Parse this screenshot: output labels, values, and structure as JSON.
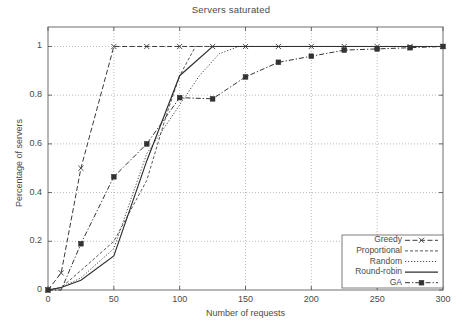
{
  "chart_data": {
    "type": "line",
    "title": "Servers saturated",
    "xlabel": "Number of requests",
    "ylabel": "Percentage of servers",
    "xlim": [
      0,
      300
    ],
    "ylim": [
      0,
      1.08
    ],
    "xticks": [
      0,
      50,
      100,
      150,
      200,
      250,
      300
    ],
    "xticklabels": [
      "0",
      "50",
      "100",
      "150",
      "200",
      "250",
      "300"
    ],
    "yticks": [
      0,
      0.2,
      0.4,
      0.6,
      0.8,
      1
    ],
    "yticklabels": [
      "0",
      "0.2",
      "0.4",
      "0.6",
      "0.8",
      "1"
    ],
    "grid": true,
    "grid_style": "dotted",
    "legend_position": "bottom-right",
    "series": [
      {
        "name": "Greedy",
        "style": "dashed",
        "marker": "x",
        "color": "#3a3a3a",
        "x": [
          0,
          10,
          25,
          50,
          75,
          100,
          125,
          150,
          175,
          200,
          225,
          250,
          275,
          300
        ],
        "y": [
          0,
          0.07,
          0.5,
          1.0,
          1.0,
          1.0,
          1.0,
          1.0,
          1.0,
          1.0,
          1.0,
          1.0,
          1.0,
          1.0
        ]
      },
      {
        "name": "Proportional",
        "style": "dashed-fine",
        "marker": "none",
        "color": "#555555",
        "x": [
          0,
          10,
          25,
          50,
          75,
          90,
          100,
          112,
          125,
          300
        ],
        "y": [
          0,
          0.01,
          0.08,
          0.2,
          0.45,
          0.72,
          0.88,
          1.0,
          1.0,
          1.0
        ]
      },
      {
        "name": "Random",
        "style": "dotted",
        "marker": "none",
        "color": "#4a4a4a",
        "x": [
          0,
          10,
          25,
          50,
          75,
          100,
          115,
          130,
          145,
          300
        ],
        "y": [
          0,
          0.01,
          0.05,
          0.17,
          0.56,
          0.76,
          0.88,
          0.97,
          1.0,
          1.0
        ]
      },
      {
        "name": "Round-robin",
        "style": "solid",
        "marker": "none",
        "color": "#2f2f2f",
        "x": [
          0,
          10,
          25,
          50,
          75,
          100,
          125,
          300
        ],
        "y": [
          0,
          0.01,
          0.04,
          0.14,
          0.53,
          0.88,
          1.0,
          1.0
        ]
      },
      {
        "name": "GA",
        "style": "dash-dot",
        "marker": "square",
        "color": "#333333",
        "x": [
          0,
          10,
          25,
          50,
          75,
          100,
          125,
          150,
          175,
          200,
          225,
          250,
          275,
          300
        ],
        "y": [
          0,
          0.0,
          0.19,
          0.465,
          0.6,
          0.79,
          0.785,
          0.875,
          0.935,
          0.96,
          0.985,
          0.99,
          0.995,
          1.0
        ]
      }
    ]
  }
}
